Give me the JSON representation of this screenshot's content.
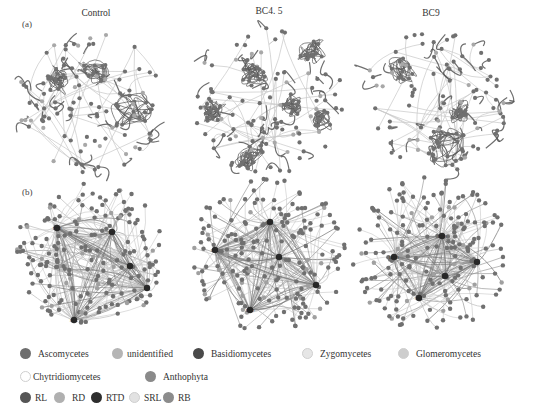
{
  "figure": {
    "row_a_label": "(a)",
    "row_b_label": "(b)",
    "panels": [
      {
        "title": "Control",
        "cx": 90,
        "cy_a": 100,
        "cy_b": 255
      },
      {
        "title": "BC4. 5",
        "cx": 268,
        "cy_a": 100,
        "cy_b": 255
      },
      {
        "title": "BC9",
        "cx": 430,
        "cy_a": 100,
        "cy_b": 255
      }
    ],
    "hub_labels": {
      "control": [
        "RTD",
        "RD",
        "RL",
        "RB",
        "SRL"
      ],
      "bc45": [
        "RD",
        "SRL",
        "RB",
        "RL",
        "RTD"
      ],
      "bc9": [
        "RTD",
        "RRD",
        "RB",
        "RL",
        "SRL"
      ]
    }
  },
  "legend": {
    "taxa": [
      {
        "label": "Ascomycetes",
        "color": "#6e6e6e"
      },
      {
        "label": "unidentified",
        "color": "#b5b5b5"
      },
      {
        "label": "Basidiomycetes",
        "color": "#4a4a4a"
      },
      {
        "label": "Zygomycetes",
        "color": "#e6e6e6"
      },
      {
        "label": "Glomeromycetes",
        "color": "#cdcdcd"
      },
      {
        "label": "Chytridiomycetes",
        "color": "#ffffff"
      },
      {
        "label": "Anthophyta",
        "color": "#8a8a8a"
      }
    ],
    "traits": [
      {
        "label": "RL",
        "color": "#555555"
      },
      {
        "label": "RD",
        "color": "#b0b0b0"
      },
      {
        "label": "RTD",
        "color": "#2e2e2e"
      },
      {
        "label": "SRL",
        "color": "#e2e2e2"
      },
      {
        "label": "RB",
        "color": "#8c8c8c"
      }
    ]
  },
  "colors": {
    "node": "#707070",
    "edge_dark": "#555555",
    "edge_light": "#c8c8c8",
    "hub": "#2a2a2a"
  }
}
